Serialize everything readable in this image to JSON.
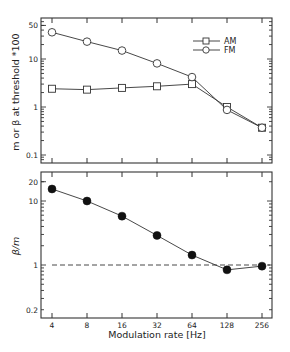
{
  "chart_data": [
    {
      "type": "line",
      "panel": "top",
      "title": "",
      "xlabel": "",
      "ylabel": "m or β at threshold *100",
      "xscale": "log2",
      "yscale": "log",
      "x": [
        4,
        8,
        16,
        32,
        64,
        128,
        256
      ],
      "ylim": [
        0.08,
        60
      ],
      "yticks": [
        0.1,
        1,
        10,
        50
      ],
      "ytick_labels": [
        "0.1",
        "1",
        "10",
        "50"
      ],
      "grid": false,
      "legend_position": "upper right",
      "series": [
        {
          "name": "AM",
          "marker": "open-square",
          "values": [
            2.4,
            2.3,
            2.5,
            2.7,
            3.0,
            1.0,
            0.37
          ]
        },
        {
          "name": "FM",
          "marker": "open-circle",
          "values": [
            36,
            23,
            15,
            8.1,
            4.2,
            0.87,
            0.37
          ]
        }
      ]
    },
    {
      "type": "line",
      "panel": "bottom",
      "title": "",
      "xlabel": "Modulation rate [Hz]",
      "ylabel": "β/m",
      "xscale": "log2",
      "yscale": "log",
      "x": [
        4,
        8,
        16,
        32,
        64,
        128,
        256
      ],
      "xtick_labels": [
        "4",
        "8",
        "16",
        "32",
        "64",
        "128",
        "256"
      ],
      "ylim": [
        0.17,
        25
      ],
      "yticks": [
        0.2,
        1,
        10,
        20
      ],
      "ytick_labels": [
        "0.2",
        "1",
        "10",
        "20"
      ],
      "grid": false,
      "reference_line": {
        "y": 1,
        "style": "dashed"
      },
      "series": [
        {
          "name": "β/m",
          "marker": "filled-circle",
          "values": [
            15.4,
            10,
            5.8,
            2.9,
            1.43,
            0.84,
            0.96
          ]
        }
      ]
    }
  ],
  "labels": {
    "top_ylabel": "m or β at threshold *100",
    "bottom_ylabel": "β/m",
    "xlabel": "Modulation rate [Hz]",
    "legend_am": "AM",
    "legend_fm": "FM"
  }
}
